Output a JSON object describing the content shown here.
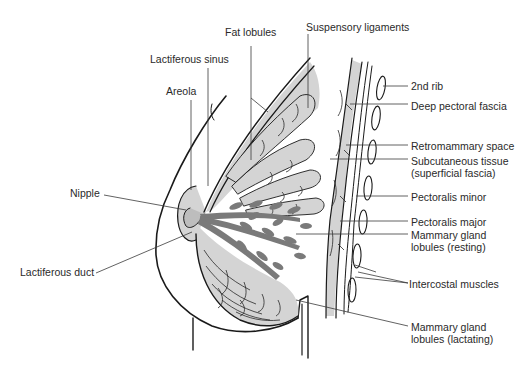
{
  "diagram": {
    "colors": {
      "background": "#ffffff",
      "outline": "#1a1a1a",
      "tissue_fill_light": "#d4d4d4",
      "tissue_fill_mid": "#bdbdbd",
      "duct_fill": "#7a7a7a",
      "label_text": "#2a2a2a"
    },
    "labels": {
      "fat_lobules": "Fat lobules",
      "suspensory_ligaments": "Suspensory ligaments",
      "lactiferous_sinus": "Lactiferous sinus",
      "areola": "Areola",
      "second_rib": "2nd rib",
      "deep_pectoral_fascia": "Deep pectoral fascia",
      "retromammary_space": "Retromammary space",
      "subcutaneous_tissue": "Subcutaneous tissue\n(superficial fascia)",
      "nipple": "Nipple",
      "pectoralis_minor": "Pectoralis minor",
      "pectoralis_major": "Pectoralis major",
      "mammary_gland_lobules_resting": "Mammary gland\nlobules (resting)",
      "lactiferous_duct": "Lactiferous duct",
      "intercostal_muscles": "Intercostal muscles",
      "mammary_gland_lobules_lactating": "Mammary gland\nlobules (lactating)"
    }
  }
}
